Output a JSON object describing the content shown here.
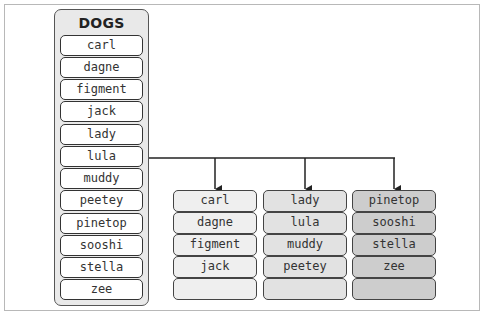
{
  "diagram": {
    "source": {
      "title": "DOGS",
      "items": [
        "carl",
        "dagne",
        "figment",
        "jack",
        "lady",
        "lula",
        "muddy",
        "peetey",
        "pinetop",
        "sooshi",
        "stella",
        "zee"
      ]
    },
    "partitions": [
      {
        "items": [
          "carl",
          "dagne",
          "figment",
          "jack",
          ""
        ],
        "fill": "#efefef"
      },
      {
        "items": [
          "lady",
          "lula",
          "muddy",
          "peetey",
          ""
        ],
        "fill": "#e2e2e2"
      },
      {
        "items": [
          "pinetop",
          "sooshi",
          "stella",
          "zee",
          ""
        ],
        "fill": "#cdcdcd"
      }
    ],
    "connector": {
      "from": "lula",
      "to": [
        "partition-1",
        "partition-2",
        "partition-3"
      ]
    }
  }
}
